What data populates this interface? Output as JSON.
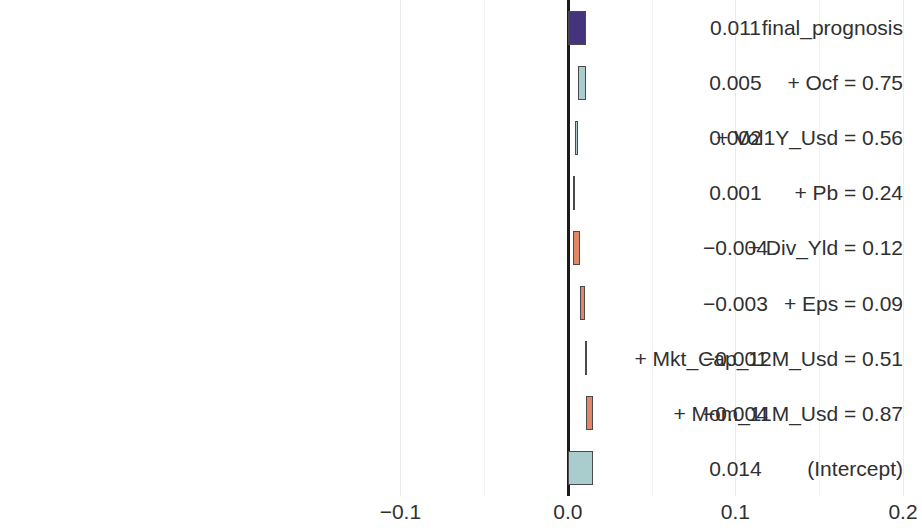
{
  "chart_data": {
    "type": "bar",
    "subtype": "break-down waterfall",
    "title": "",
    "subtitle": "",
    "xlabel": "",
    "ylabel": "",
    "xlim": [
      -0.142,
      0.2
    ],
    "grid": true,
    "legend": null,
    "x_ticks": [
      {
        "label": "−0.1",
        "value": -0.1
      },
      {
        "label": "0.0",
        "value": 0.0
      },
      {
        "label": "0.1",
        "value": 0.1
      },
      {
        "label": "0.2",
        "value": 0.2
      }
    ],
    "x_minor_ticks": [
      -0.05,
      0.05,
      0.15
    ],
    "categories": [
      "final_prognosis",
      "+ Ocf = 0.75",
      "+ Vol1Y_Usd = 0.56",
      "+ Pb = 0.24",
      "+ Div_Yld = 0.12",
      "+ Eps = 0.09",
      "+ Mkt_Cap_12M_Usd = 0.51",
      "+ Mom_11M_Usd = 0.87",
      "(Intercept)"
    ],
    "value_labels": [
      "0.011",
      "0.005",
      "0.002",
      "0.001",
      "−0.004",
      "−0.003",
      "−0.001",
      "−0.004",
      "0.014"
    ],
    "values": [
      0.011,
      0.005,
      0.002,
      0.001,
      -0.004,
      -0.003,
      -0.001,
      -0.004,
      0.014
    ],
    "bars": [
      {
        "label": "final_prognosis",
        "value_label": "0.011",
        "value": 0.011,
        "start": 0.0,
        "end": 0.011,
        "kind": "total",
        "color": "#46337e"
      },
      {
        "label": "+ Ocf = 0.75",
        "value_label": "0.005",
        "value": 0.005,
        "start": 0.006,
        "end": 0.011,
        "kind": "positive",
        "color": "#a9cccd"
      },
      {
        "label": "+ Vol1Y_Usd = 0.56",
        "value_label": "0.002",
        "value": 0.002,
        "start": 0.004,
        "end": 0.006,
        "kind": "positive",
        "color": "#a9cccd"
      },
      {
        "label": "+ Pb = 0.24",
        "value_label": "0.001",
        "value": 0.001,
        "start": 0.003,
        "end": 0.004,
        "kind": "positive",
        "color": "#a9cccd"
      },
      {
        "label": "+ Div_Yld = 0.12",
        "value_label": "−0.004",
        "value": -0.004,
        "start": 0.007,
        "end": 0.003,
        "kind": "negative",
        "color": "#e08765"
      },
      {
        "label": "+ Eps = 0.09",
        "value_label": "−0.003",
        "value": -0.003,
        "start": 0.01,
        "end": 0.007,
        "kind": "negative",
        "color": "#e08765"
      },
      {
        "label": "+ Mkt_Cap_12M_Usd = 0.51",
        "value_label": "−0.001",
        "value": -0.001,
        "start": 0.011,
        "end": 0.01,
        "kind": "negative",
        "color": "#e08765"
      },
      {
        "label": "+ Mom_11M_Usd = 0.87",
        "value_label": "−0.004",
        "value": -0.004,
        "start": 0.015,
        "end": 0.011,
        "kind": "negative",
        "color": "#e08765"
      },
      {
        "label": "(Intercept)",
        "value_label": "0.014",
        "value": 0.014,
        "start": 0.0,
        "end": 0.015,
        "kind": "intercept",
        "color": "#a9cccd"
      }
    ],
    "colors": {
      "total": "#46337e",
      "positive": "#a9cccd",
      "negative": "#e08765",
      "intercept": "#a9cccd",
      "grid": "#ebebeb",
      "zero_axis": "#1a1a1a",
      "text": "#303030",
      "background": "#ffffff"
    }
  }
}
